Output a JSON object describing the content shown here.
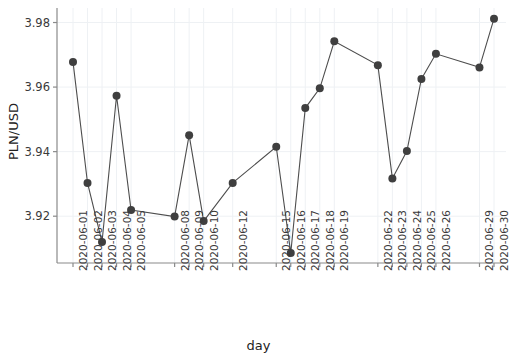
{
  "chart_data": {
    "type": "line",
    "title": "",
    "xlabel": "day",
    "ylabel": "PLN/USD",
    "ylim": [
      3.9055,
      3.9845
    ],
    "yticks": [
      3.92,
      3.94,
      3.96,
      3.98
    ],
    "ytick_labels": [
      "3.92",
      "3.94",
      "3.96",
      "3.98"
    ],
    "grid": true,
    "legend": false,
    "marker": "circle",
    "line_color": "#4d4d4d",
    "marker_color": "#3f3f3f",
    "grid_color": "#eef1f4",
    "categories": [
      "2020-06-01",
      "2020-06-02",
      "2020-06-03",
      "2020-06-04",
      "2020-06-05",
      "2020-06-08",
      "2020-06-09",
      "2020-06-10",
      "2020-06-12",
      "2020-06-15",
      "2020-06-16",
      "2020-06-17",
      "2020-06-18",
      "2020-06-19",
      "2020-06-22",
      "2020-06-23",
      "2020-06-24",
      "2020-06-25",
      "2020-06-26",
      "2020-06-29",
      "2020-06-30"
    ],
    "tick_slots": [
      0,
      1,
      2,
      3,
      4,
      7,
      8,
      9,
      11,
      14,
      15,
      16,
      17,
      18,
      21,
      22,
      23,
      24,
      25,
      28,
      29
    ],
    "values": [
      3.9678,
      3.9303,
      3.912,
      3.9573,
      3.9219,
      3.9199,
      3.9451,
      3.9185,
      3.9303,
      3.9415,
      3.9086,
      3.9535,
      3.9596,
      3.9742,
      3.9668,
      3.9317,
      3.9402,
      3.9625,
      3.9703,
      3.9661,
      3.9812
    ],
    "n_slots": 30
  },
  "axis": {
    "ylabel_text": "PLN/USD",
    "xlabel_text": "day"
  }
}
